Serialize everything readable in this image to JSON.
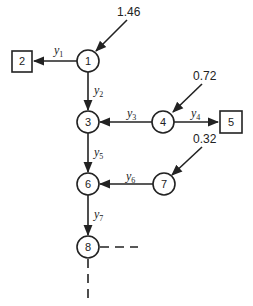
{
  "diagram": {
    "nodes": [
      {
        "id": "1",
        "shape": "circle",
        "x": 88,
        "y": 61
      },
      {
        "id": "2",
        "shape": "square",
        "x": 22,
        "y": 61
      },
      {
        "id": "3",
        "shape": "circle",
        "x": 88,
        "y": 122
      },
      {
        "id": "4",
        "shape": "circle",
        "x": 163,
        "y": 122
      },
      {
        "id": "5",
        "shape": "square",
        "x": 231,
        "y": 122
      },
      {
        "id": "6",
        "shape": "circle",
        "x": 88,
        "y": 184
      },
      {
        "id": "7",
        "shape": "circle",
        "x": 164,
        "y": 184
      },
      {
        "id": "8",
        "shape": "circle",
        "x": 88,
        "y": 247
      }
    ],
    "edges": [
      {
        "from": "1",
        "to": "2",
        "label": "y",
        "sub": "1"
      },
      {
        "from": "1",
        "to": "3",
        "label": "y",
        "sub": "2"
      },
      {
        "from": "4",
        "to": "3",
        "label": "y",
        "sub": "3"
      },
      {
        "from": "4",
        "to": "5",
        "label": "y",
        "sub": "4"
      },
      {
        "from": "3",
        "to": "6",
        "label": "y",
        "sub": "5"
      },
      {
        "from": "7",
        "to": "6",
        "label": "y",
        "sub": "6"
      },
      {
        "from": "6",
        "to": "8",
        "label": "y",
        "sub": "7"
      }
    ],
    "inputs": [
      {
        "to": "1",
        "value": "1.46"
      },
      {
        "to": "4",
        "value": "0.72"
      },
      {
        "to": "7",
        "value": "0.32"
      }
    ],
    "continuation": "dashed lines from node 8 (right and down)"
  }
}
